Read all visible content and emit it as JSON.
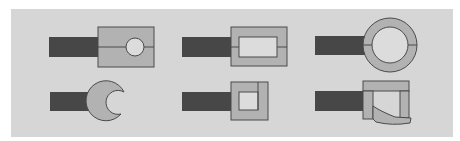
{
  "diagram": {
    "title": "",
    "background_panel": "#d6d6d6",
    "colors": {
      "handle": "#474747",
      "piece_fill": "#b2b2b2",
      "inner_fill": "#dcdcdc",
      "stroke": "#4a4a4a"
    },
    "items": [
      {
        "id": "split-block-round-hole",
        "row": 1,
        "col": 1,
        "description": "Dark bar attached to rectangular block split horizontally with circular hole"
      },
      {
        "id": "split-frame-rect-window",
        "row": 1,
        "col": 2,
        "description": "Dark bar attached to rectangular frame with rectangular window, split horizontally"
      },
      {
        "id": "split-ring",
        "row": 1,
        "col": 3,
        "description": "Dark bar attached to circular ring split horizontally"
      },
      {
        "id": "open-crescent",
        "row": 2,
        "col": 1,
        "description": "Dark bar attached to open C-shaped crescent"
      },
      {
        "id": "square-frame-side-piece",
        "row": 2,
        "col": 2,
        "description": "Dark bar attached to square frame with separate right-side piece"
      },
      {
        "id": "frame-curved-bottom",
        "row": 2,
        "col": 3,
        "description": "Dark bar attached to frame with curved bottom jaw"
      }
    ]
  }
}
